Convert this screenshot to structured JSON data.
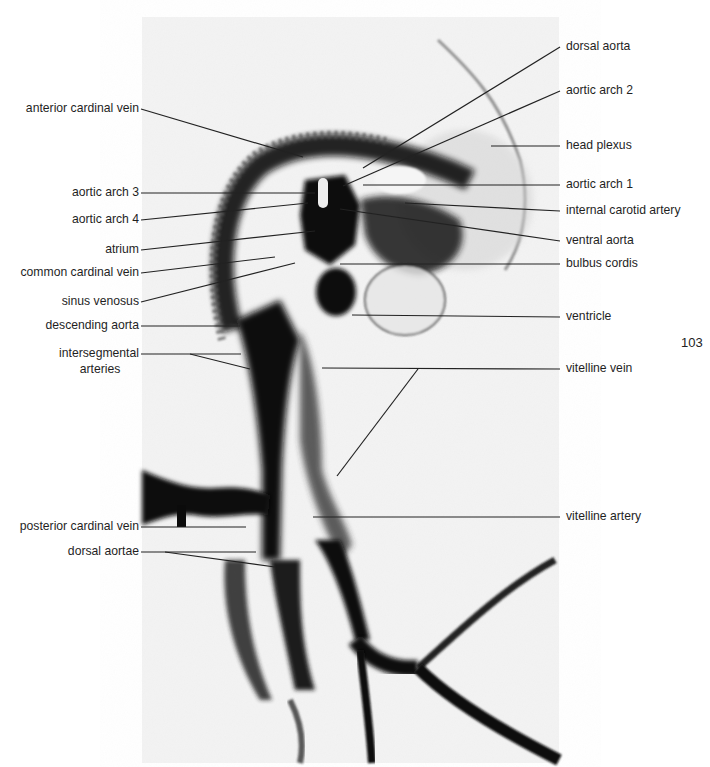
{
  "figure": {
    "page_number": "103",
    "photo_bounds": {
      "x": 142,
      "y": 17,
      "width": 417,
      "height": 746
    },
    "colors": {
      "background": "#ffffff",
      "photo_bg": "#f2f2f2",
      "ink": "#111111",
      "leader": "#222222",
      "text": "#1f1f1f"
    }
  },
  "labels_left": [
    {
      "id": "anterior-cardinal-vein",
      "text": "anterior cardinal vein",
      "y": 109,
      "lines": [
        [
          141,
          109,
          303,
          157
        ]
      ]
    },
    {
      "id": "aortic-arch-3",
      "text": "aortic arch 3",
      "y": 193,
      "lines": [
        [
          141,
          193,
          315,
          193
        ]
      ]
    },
    {
      "id": "aortic-arch-4",
      "text": "aortic arch 4",
      "y": 220,
      "lines": [
        [
          141,
          220,
          308,
          203
        ]
      ]
    },
    {
      "id": "atrium",
      "text": "atrium",
      "y": 250,
      "lines": [
        [
          141,
          250,
          315,
          231
        ]
      ]
    },
    {
      "id": "common-cardinal-vein",
      "text": "common cardinal vein",
      "y": 273,
      "lines": [
        [
          141,
          273,
          275,
          257
        ]
      ]
    },
    {
      "id": "sinus-venosus",
      "text": "sinus venosus",
      "y": 302,
      "lines": [
        [
          141,
          302,
          295,
          263
        ]
      ]
    },
    {
      "id": "descending-aorta",
      "text": "descending aorta",
      "y": 326,
      "lines": [
        [
          141,
          326,
          240,
          326
        ]
      ]
    },
    {
      "id": "intersegmental-arteries",
      "text": "intersegmental",
      "text2": "arteries",
      "y": 354,
      "lines": [
        [
          141,
          354,
          241,
          354
        ],
        [
          190,
          354,
          250,
          369
        ]
      ]
    },
    {
      "id": "posterior-cardinal-vein",
      "text": "posterior cardinal vein",
      "y": 527,
      "lines": [
        [
          141,
          527,
          246,
          527
        ]
      ]
    },
    {
      "id": "dorsal-aortae",
      "text": "dorsal aortae",
      "y": 552,
      "lines": [
        [
          141,
          552,
          256,
          552
        ],
        [
          165,
          552,
          275,
          567
        ]
      ]
    }
  ],
  "labels_right": [
    {
      "id": "dorsal-aorta",
      "text": "dorsal aorta",
      "y": 47,
      "lines": [
        [
          560,
          47,
          363,
          168
        ]
      ]
    },
    {
      "id": "aortic-arch-2",
      "text": "aortic arch 2",
      "y": 91,
      "lines": [
        [
          560,
          91,
          343,
          186
        ]
      ]
    },
    {
      "id": "head-plexus",
      "text": "head plexus",
      "y": 146,
      "lines": [
        [
          560,
          146,
          491,
          146
        ]
      ]
    },
    {
      "id": "aortic-arch-1",
      "text": "aortic arch 1",
      "y": 185,
      "lines": [
        [
          560,
          185,
          363,
          185
        ]
      ]
    },
    {
      "id": "internal-carotid-artery",
      "text": "internal carotid artery",
      "y": 211,
      "lines": [
        [
          560,
          211,
          405,
          203
        ]
      ]
    },
    {
      "id": "ventral-aorta",
      "text": "ventral aorta",
      "y": 241,
      "lines": [
        [
          560,
          241,
          340,
          209
        ]
      ]
    },
    {
      "id": "bulbus-cordis",
      "text": "bulbus cordis",
      "y": 264,
      "lines": [
        [
          560,
          264,
          340,
          264
        ]
      ]
    },
    {
      "id": "ventricle",
      "text": "ventricle",
      "y": 317,
      "lines": [
        [
          560,
          317,
          352,
          315
        ]
      ]
    },
    {
      "id": "vitelline-vein",
      "text": "vitelline vein",
      "y": 369,
      "lines": [
        [
          560,
          369,
          322,
          368
        ],
        [
          418,
          369,
          337,
          476
        ]
      ]
    },
    {
      "id": "vitelline-artery",
      "text": "vitelline artery",
      "y": 517,
      "lines": [
        [
          560,
          517,
          313,
          517
        ]
      ]
    }
  ]
}
